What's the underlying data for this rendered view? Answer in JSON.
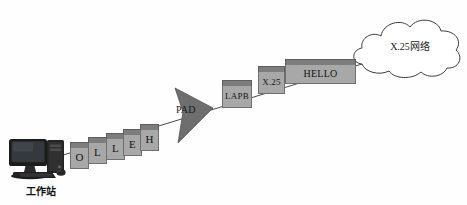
{
  "diagram": {
    "background_color": "#fefefe",
    "line_color": "#4a4a4a",
    "box_fill": "#a8a8a8",
    "box_cap_fill": "#7d7d7d",
    "box_border": "#6f6f6f"
  },
  "workstation": {
    "label": "工作站",
    "icon": "desktop-computer-icon"
  },
  "letters": [
    {
      "label": "O"
    },
    {
      "label": "L"
    },
    {
      "label": "L"
    },
    {
      "label": "E"
    },
    {
      "label": "H"
    }
  ],
  "pad": {
    "label": "PAD",
    "shape": "triangle"
  },
  "protocol_boxes": [
    {
      "label": "LAPB"
    },
    {
      "label": "X.25"
    },
    {
      "label": "HELLO"
    }
  ],
  "cloud": {
    "label": "X.25网络",
    "shape": "cloud"
  }
}
